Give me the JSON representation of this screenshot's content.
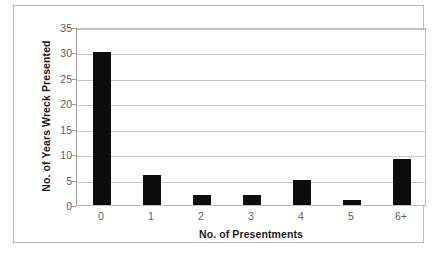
{
  "chart_data": {
    "type": "bar",
    "title": "",
    "categories": [
      "0",
      "1",
      "2",
      "3",
      "4",
      "5",
      "6+"
    ],
    "values": [
      30,
      6,
      2,
      2,
      5,
      1,
      9
    ],
    "xlabel": "No. of Presentments",
    "ylabel": "No. of Years Wreck Presented",
    "ylim": [
      0,
      35
    ],
    "ytick_labels": [
      "0",
      "5",
      "10",
      "15",
      "20",
      "25",
      "30",
      "35"
    ],
    "ytick_values": [
      0,
      5,
      10,
      15,
      20,
      25,
      30,
      35
    ],
    "grid": true,
    "legend": "none",
    "bar_color": "#0d0d0d",
    "grid_color": "#c9c9c9",
    "axis_color": "#9a9a9a",
    "background": "#ffffff"
  },
  "caption": {
    "text": ""
  }
}
